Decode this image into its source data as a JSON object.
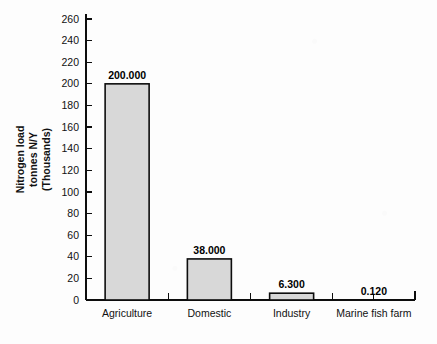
{
  "chart_data": {
    "type": "bar",
    "title": "",
    "subtitle": "",
    "xlabel": "",
    "ylabel": "Nitrogen load tonnes N/Y (Thousands)",
    "ylabel_lines": [
      "Nitrogen load",
      "tonnes N/Y",
      "(Thousands)"
    ],
    "categories": [
      "Agriculture",
      "Domestic",
      "Industry",
      "Marine fish farm"
    ],
    "values": [
      200.0,
      38.0,
      6.3,
      0.12
    ],
    "value_labels": [
      "200.000",
      "38.000",
      "6.300",
      "0.120"
    ],
    "ylim": [
      0,
      260
    ],
    "ytick_step": 20,
    "ytick_labels": [
      "0",
      "20",
      "40",
      "60",
      "80",
      "100",
      "120",
      "140",
      "160",
      "180",
      "200",
      "220",
      "240",
      "260"
    ],
    "ytick_values": [
      0,
      20,
      40,
      60,
      80,
      100,
      120,
      140,
      160,
      180,
      200,
      220,
      240,
      260
    ],
    "grid": false,
    "legend": false,
    "legend_position": "none",
    "bar_fill_color": "#d8d8d8",
    "bar_border_color": "#0d0d0d",
    "axis_color": "#0d0d0d",
    "background_color": "#fdfdfd"
  }
}
